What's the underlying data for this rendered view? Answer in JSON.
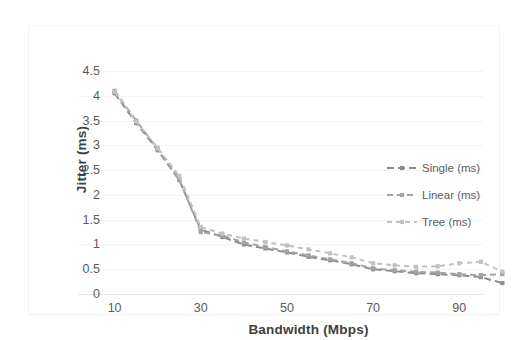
{
  "chart_data": {
    "type": "line",
    "title": "",
    "subtitle": "",
    "xlabel": "Bandwidth (Mbps)",
    "ylabel": "Jitter  (ms)",
    "xlim": [
      8,
      102
    ],
    "ylim": [
      0,
      4.5
    ],
    "grid": true,
    "grid_axis": "y",
    "legend_position": "center-right",
    "x_ticks": [
      10,
      30,
      50,
      70,
      90
    ],
    "x_tick_labels": [
      "10",
      "30",
      "50",
      "70",
      "90"
    ],
    "y_ticks": [
      0,
      0.5,
      1,
      1.5,
      2,
      2.5,
      3,
      3.5,
      4,
      4.5
    ],
    "y_tick_labels": [
      "0",
      "0.5",
      "1",
      "1.5",
      "2",
      "2.5",
      "3",
      "3.5",
      "4",
      "4.5"
    ],
    "x": [
      10,
      15,
      20,
      25,
      30,
      35,
      40,
      45,
      50,
      55,
      60,
      65,
      70,
      75,
      80,
      85,
      90,
      95,
      100
    ],
    "series": [
      {
        "name": "Single (ms)",
        "label": "Single (ms)",
        "color": "#8c8c8c",
        "dash": "7,4",
        "marker": "square",
        "values": [
          4.05,
          3.45,
          2.9,
          2.3,
          1.3,
          1.15,
          1.0,
          0.92,
          0.84,
          0.75,
          0.68,
          0.6,
          0.5,
          0.46,
          0.42,
          0.4,
          0.38,
          0.34,
          0.22
        ]
      },
      {
        "name": "Linear (ms)",
        "label": "Linear (ms)",
        "color": "#a3a3a3",
        "dash": "6,4",
        "marker": "square",
        "values": [
          4.1,
          3.5,
          2.92,
          2.32,
          1.25,
          1.18,
          1.04,
          0.95,
          0.86,
          0.78,
          0.7,
          0.62,
          0.52,
          0.48,
          0.45,
          0.43,
          0.4,
          0.38,
          0.4
        ]
      },
      {
        "name": "Tree (ms)",
        "label": "Tree (ms)",
        "color": "#c2c2c2",
        "dash": "5,4",
        "marker": "square",
        "values": [
          4.08,
          3.48,
          2.95,
          2.38,
          1.35,
          1.22,
          1.12,
          1.05,
          0.98,
          0.9,
          0.82,
          0.74,
          0.62,
          0.58,
          0.55,
          0.56,
          0.62,
          0.65,
          0.45
        ]
      }
    ]
  },
  "legend": {
    "items": [
      {
        "label": "Single (ms)"
      },
      {
        "label": "Linear (ms)"
      },
      {
        "label": "Tree (ms)"
      }
    ]
  },
  "axes": {
    "x_title": "Bandwidth (Mbps)",
    "y_title": "Jitter  (ms)"
  }
}
